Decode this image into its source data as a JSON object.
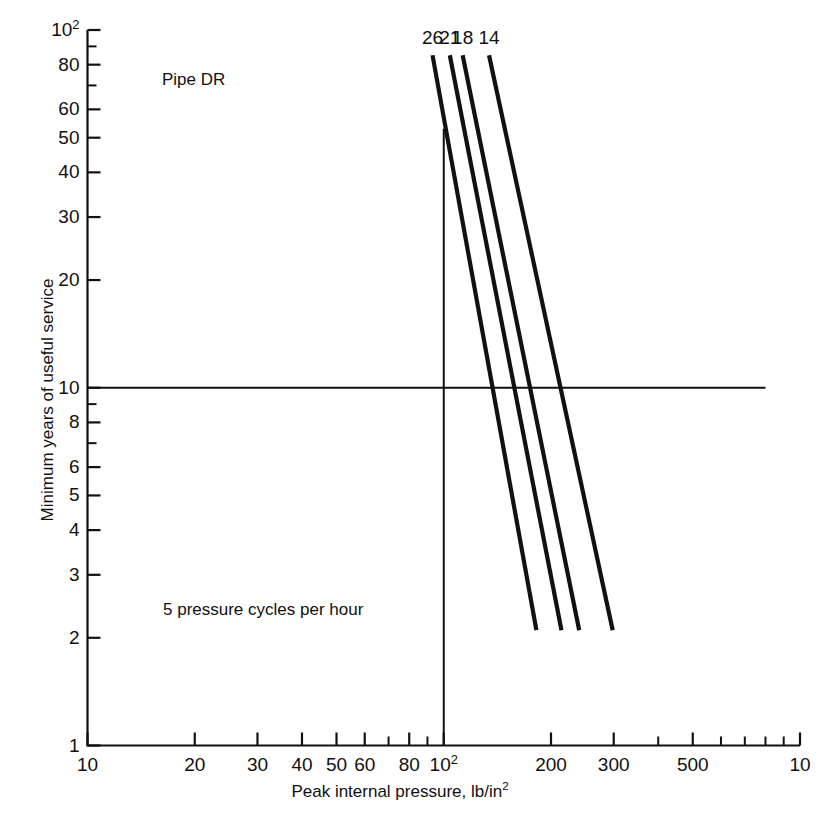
{
  "figure": {
    "annotations": [
      {
        "name": "pipe-dr",
        "text": "Pipe DR"
      },
      {
        "name": "pressure-cycles",
        "text": "5 pressure cycles per hour"
      }
    ]
  },
  "chart_data": {
    "type": "line",
    "title": "",
    "xlabel": "Peak internal pressure, lb/in",
    "xlabel_sup": "2",
    "ylabel": "Minimum years of useful service",
    "xscale": "log",
    "yscale": "log",
    "xlim": [
      10,
      1000
    ],
    "ylim": [
      1,
      100
    ],
    "grid": false,
    "legend_position": "inline-top",
    "x_ticks": [
      {
        "value": 10,
        "label": "10",
        "major": true
      },
      {
        "value": 20,
        "label": "20",
        "major": true
      },
      {
        "value": 30,
        "label": "30",
        "major": true
      },
      {
        "value": 40,
        "label": "40",
        "major": true
      },
      {
        "value": 50,
        "label": "50",
        "major": true
      },
      {
        "value": 60,
        "label": "60",
        "major": true
      },
      {
        "value": 70,
        "label": "",
        "major": false
      },
      {
        "value": 80,
        "label": "80",
        "major": true
      },
      {
        "value": 90,
        "label": "",
        "major": false
      },
      {
        "value": 100,
        "label": "10",
        "sup": "2",
        "major": true
      },
      {
        "value": 200,
        "label": "200",
        "major": true
      },
      {
        "value": 300,
        "label": "300",
        "major": true
      },
      {
        "value": 400,
        "label": "",
        "major": false
      },
      {
        "value": 500,
        "label": "500",
        "major": true
      },
      {
        "value": 600,
        "label": "",
        "major": false
      },
      {
        "value": 700,
        "label": "",
        "major": false
      },
      {
        "value": 800,
        "label": "",
        "major": false
      },
      {
        "value": 900,
        "label": "",
        "major": false
      },
      {
        "value": 1000,
        "label": "10",
        "sup": "",
        "major": true
      }
    ],
    "y_ticks": [
      {
        "value": 100,
        "label": "10",
        "sup": "2",
        "major": true
      },
      {
        "value": 90,
        "label": "",
        "major": false
      },
      {
        "value": 80,
        "label": "80",
        "major": true
      },
      {
        "value": 70,
        "label": "",
        "major": false
      },
      {
        "value": 60,
        "label": "60",
        "major": true
      },
      {
        "value": 50,
        "label": "50",
        "major": true
      },
      {
        "value": 40,
        "label": "40",
        "major": true
      },
      {
        "value": 30,
        "label": "30",
        "major": true
      },
      {
        "value": 20,
        "label": "20",
        "major": true
      },
      {
        "value": 10,
        "label": "10",
        "major": true
      },
      {
        "value": 9,
        "label": "",
        "major": false
      },
      {
        "value": 8,
        "label": "8",
        "major": true
      },
      {
        "value": 7,
        "label": "",
        "major": false
      },
      {
        "value": 6,
        "label": "6",
        "major": true
      },
      {
        "value": 5,
        "label": "5",
        "major": true
      },
      {
        "value": 4,
        "label": "4",
        "major": true
      },
      {
        "value": 3,
        "label": "3",
        "major": true
      },
      {
        "value": 2,
        "label": "2",
        "major": true
      },
      {
        "value": 1,
        "label": "1",
        "major": true
      }
    ],
    "reference_lines": [
      {
        "name": "service-life-10-years",
        "orientation": "horizontal",
        "value": 10,
        "x_from": 10,
        "x_to": 800
      },
      {
        "name": "pressure-100-psi",
        "orientation": "vertical",
        "value": 100,
        "y_from": 1,
        "y_to": 53
      }
    ],
    "series": [
      {
        "name": "DR 26",
        "label": "26",
        "points": [
          [
            93,
            85
          ],
          [
            182,
            2.1
          ]
        ]
      },
      {
        "name": "DR 21",
        "label": "21",
        "points": [
          [
            104,
            85
          ],
          [
            214,
            2.1
          ]
        ]
      },
      {
        "name": "DR 18",
        "label": "18",
        "points": [
          [
            113,
            85
          ],
          [
            240,
            2.1
          ]
        ]
      },
      {
        "name": "DR 14",
        "label": "14",
        "points": [
          [
            134,
            85
          ],
          [
            298,
            2.1
          ]
        ]
      }
    ]
  }
}
